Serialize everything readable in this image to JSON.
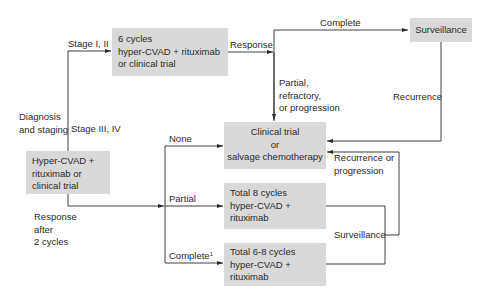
{
  "diagram": {
    "type": "treatment-flowchart",
    "colors": {
      "box_fill": "#d9d9d9",
      "line": "#2a2a2a",
      "text": "#2a2a2a"
    },
    "nodes": {
      "initial": {
        "lines": [
          "Hyper-CVAD +",
          "rituximab or",
          "clinical trial"
        ]
      },
      "early_stage": {
        "lines": [
          "6 cycles",
          "hyper-CVAD + rituximab",
          "or clinical trial"
        ]
      },
      "surveillance": {
        "lines": [
          "Surveillance"
        ]
      },
      "salvage": {
        "lines": [
          "Clinical trial",
          "or",
          "salvage chemotherapy"
        ]
      },
      "total8": {
        "lines": [
          "Total 8 cycles",
          "hyper-CVAD +",
          "rituximab"
        ]
      },
      "total68": {
        "lines": [
          "Total 6-8 cycles",
          "hyper-CVAD +",
          "rituximab"
        ]
      }
    },
    "labels": {
      "diagnosis": [
        "Diagnosis",
        "and staging"
      ],
      "stage12": "Stage I, II",
      "stage34": "Stage III, IV",
      "response": "Response",
      "complete_top": "Complete",
      "partial_refractory": [
        "Partial,",
        "refractory,",
        "or progression"
      ],
      "recurrence": "Recurrence",
      "recurrence_progression": [
        "Recurrence or",
        "progression"
      ],
      "surveillance_bracket": "Surveillance",
      "response_after": [
        "Response",
        "after",
        "2 cycles"
      ],
      "none": "None",
      "partial": "Partial",
      "complete_bottom": "Complete",
      "complete_footnote": "1"
    },
    "edges": [
      {
        "from": "diagnosis",
        "to": "early_stage",
        "label": "Stage I, II"
      },
      {
        "from": "diagnosis",
        "to": "initial",
        "label": "Stage III, IV"
      },
      {
        "from": "early_stage",
        "to": "surveillance",
        "label": "Response → Complete"
      },
      {
        "from": "early_stage",
        "to": "salvage",
        "label": "Partial, refractory, or progression"
      },
      {
        "from": "surveillance",
        "to": "salvage",
        "label": "Recurrence"
      },
      {
        "from": "initial",
        "to": "salvage",
        "label": "Response after 2 cycles: None"
      },
      {
        "from": "initial",
        "to": "total8",
        "label": "Response after 2 cycles: Partial"
      },
      {
        "from": "initial",
        "to": "total68",
        "label": "Response after 2 cycles: Complete¹"
      },
      {
        "from": "total8+total68",
        "to": "salvage",
        "label": "Surveillance → Recurrence or progression"
      }
    ]
  }
}
